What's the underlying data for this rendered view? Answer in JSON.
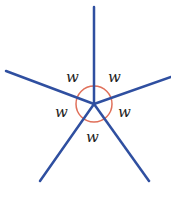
{
  "diagram": {
    "center": [
      94,
      104
    ],
    "ray_color": "#2f4fa0",
    "circle_color": "#e0705a",
    "circle_radius": 18,
    "rays": [
      {
        "name": "up",
        "end": [
          94,
          7
        ]
      },
      {
        "name": "left",
        "end": [
          6,
          71
        ]
      },
      {
        "name": "right",
        "end": [
          171,
          77
        ]
      },
      {
        "name": "down-left",
        "end": [
          40,
          181
        ]
      },
      {
        "name": "down-right",
        "end": [
          149,
          181
        ]
      }
    ],
    "labels": [
      {
        "text": "w",
        "x": 68,
        "y": 82
      },
      {
        "text": "w",
        "x": 110,
        "y": 82
      },
      {
        "text": "w",
        "x": 57,
        "y": 117
      },
      {
        "text": "w",
        "x": 120,
        "y": 117
      },
      {
        "text": "w",
        "x": 88,
        "y": 142
      }
    ]
  }
}
